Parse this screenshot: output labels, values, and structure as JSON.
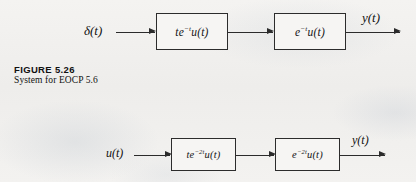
{
  "page": {
    "background_color": "#f2f1ef",
    "ink_color": "#2b2b2b"
  },
  "caption": {
    "title": "FIGURE 5.26",
    "subtitle": "System for EOCP 5.6"
  },
  "diagrams": [
    {
      "id": "top-diagram",
      "input_label": "δ(t)",
      "output_label": "y(t)",
      "blocks": [
        {
          "id": "block-1",
          "base": "te",
          "exponent": "−t",
          "suffix": "u(t)"
        },
        {
          "id": "block-2",
          "base": "e",
          "exponent": "−t",
          "suffix": "u(t)"
        }
      ]
    },
    {
      "id": "bottom-diagram",
      "input_label": "u(t)",
      "output_label": "y(t)",
      "blocks": [
        {
          "id": "block-1",
          "base": "te",
          "exponent": "−2t",
          "suffix": "u(t)"
        },
        {
          "id": "block-2",
          "base": "e",
          "exponent": "−2t",
          "suffix": "u(t)"
        }
      ]
    }
  ]
}
